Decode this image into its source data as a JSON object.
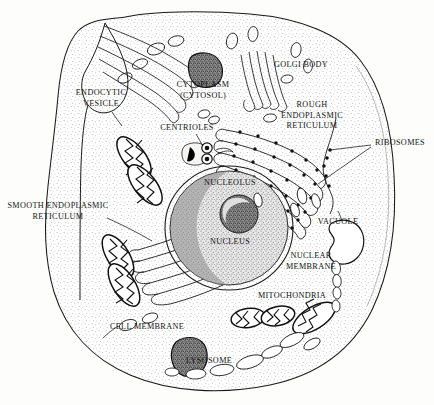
{
  "diagram": {
    "style": "black-and-white stippled line drawing"
  },
  "colors": {
    "ink": "#141414",
    "line": "#1a1a1a",
    "cytoplasm_stipple": "#6d6d6d",
    "nucleus_fill": "#9a9a9a",
    "dark_organelle": "#4a4a4a",
    "background": "#fdfdfb"
  },
  "labels": {
    "endocytic_vesicle": "ENDOCYTIC\nVESICLE",
    "cytoplasm": "CYTOPLASM\n(CYTOSOL)",
    "golgi_body": "GOLGI BODY",
    "rough_er": "ROUGH\nENDOPLASMIC\nRETICULUM",
    "ribosomes": "RIBOSOMES",
    "centrioles": "CENTRIOLES",
    "nucleolus": "NUCLEOLUS",
    "nucleus": "NUCLEUS",
    "smooth_er": "SMOOTH ENDOPLASMIC\nRETICULUM",
    "vacuole": "VACUOLE",
    "nuclear_membrane": "NUCLEAR\nMEMBRANE",
    "mitochondria": "MITOCHONDRIA",
    "cell_membrane": "CELL MEMBRANE",
    "lysosome": "LYSOSOME"
  },
  "structures": [
    {
      "name": "cell-membrane",
      "description": "outer boundary of the cell with an invagination on the left side"
    },
    {
      "name": "cytoplasm",
      "description": "stippled interior region filling the cell"
    },
    {
      "name": "nucleus",
      "description": "large stippled sphere at center"
    },
    {
      "name": "nucleolus",
      "description": "small dense sphere inside the nucleus"
    },
    {
      "name": "nuclear-membrane",
      "description": "double outline around the nucleus"
    },
    {
      "name": "golgi-body",
      "description": "stacks of flattened curved cisternae, upper-left and upper-right"
    },
    {
      "name": "rough-endoplasmic-reticulum",
      "description": "curved channels studded with ribosome dots, right of nucleus"
    },
    {
      "name": "smooth-endoplasmic-reticulum",
      "description": "curved channels without dots, lower-left of nucleus"
    },
    {
      "name": "ribosomes",
      "description": "small black dots on the rough ER membranes"
    },
    {
      "name": "mitochondria",
      "description": "oval organelles with internal zigzag cristae"
    },
    {
      "name": "centrioles",
      "description": "paired concentric-ring circles above the nucleus"
    },
    {
      "name": "lysosome",
      "description": "dark stippled blob near the lower membrane"
    },
    {
      "name": "vacuole",
      "description": "kidney-shaped empty outline right of the nucleus"
    },
    {
      "name": "vesicles",
      "description": "small oval outlines scattered in the cytoplasm"
    }
  ]
}
